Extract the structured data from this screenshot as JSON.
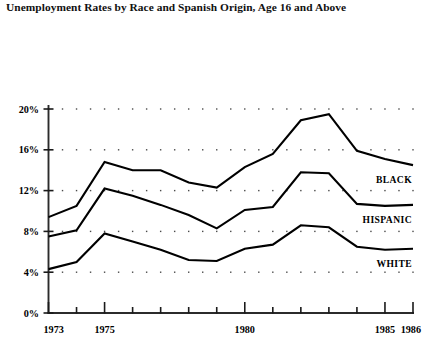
{
  "chart_data": {
    "type": "line",
    "title": "Unemployment Rates by Race and Spanish Origin, Age 16 and Above",
    "xlabel": "",
    "ylabel": "",
    "x": [
      1973,
      1974,
      1975,
      1976,
      1977,
      1978,
      1979,
      1980,
      1981,
      1982,
      1983,
      1984,
      1985,
      1986
    ],
    "xlim": [
      1973,
      1986
    ],
    "ylim": [
      0,
      20
    ],
    "xtick_labels": [
      "1973",
      "1975",
      "1980",
      "1985",
      "1986"
    ],
    "xtick_values": [
      1973,
      1975,
      1980,
      1985,
      1986
    ],
    "ytick_labels": [
      "0%",
      "4%",
      "8%",
      "12%",
      "16%",
      "20%"
    ],
    "ytick_values": [
      0,
      4,
      8,
      12,
      16,
      20
    ],
    "grid": "dotted-horizontal",
    "legend_position": "right-inline-labels",
    "series": [
      {
        "name": "BLACK",
        "label": "BLACK",
        "color": "#000000",
        "values": [
          9.4,
          10.5,
          14.8,
          14.0,
          14.0,
          12.8,
          12.3,
          14.3,
          15.6,
          18.9,
          19.5,
          15.9,
          15.1,
          14.5
        ]
      },
      {
        "name": "HISPANIC",
        "label": "HISPANIC",
        "color": "#000000",
        "values": [
          7.5,
          8.1,
          12.2,
          11.5,
          10.6,
          9.6,
          8.3,
          10.1,
          10.4,
          13.8,
          13.7,
          10.7,
          10.5,
          10.6
        ]
      },
      {
        "name": "WHITE",
        "label": "WHITE",
        "color": "#000000",
        "values": [
          4.3,
          5.0,
          7.8,
          7.0,
          6.2,
          5.2,
          5.1,
          6.3,
          6.7,
          8.6,
          8.4,
          6.5,
          6.2,
          6.3
        ]
      }
    ]
  }
}
